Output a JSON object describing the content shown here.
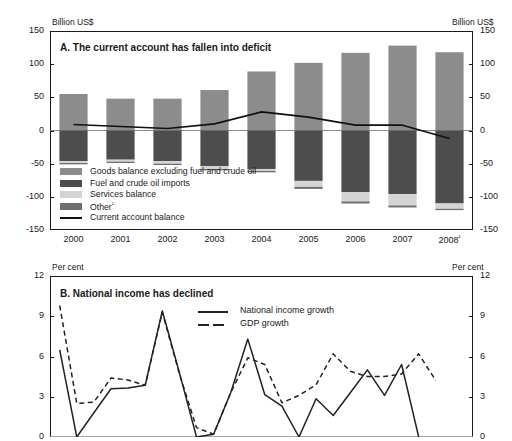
{
  "chart_data": [
    {
      "type": "bar",
      "id": "panel-a",
      "title": "A. The current account has fallen into deficit",
      "ylabel_left": "Billion US$",
      "ylabel_right": "Billion US$",
      "xlabel": "",
      "ylim": [
        -150,
        150
      ],
      "yticks": [
        150,
        100,
        50,
        0,
        -50,
        -100,
        -150
      ],
      "ytick_labels": [
        "150",
        "100",
        "50",
        "0",
        "-50",
        "-100",
        "-150"
      ],
      "grid": false,
      "stacked": true,
      "categories": [
        "2000",
        "2001",
        "2002",
        "2003",
        "2004",
        "2005",
        "2006",
        "2007",
        "2008"
      ],
      "category_labels": [
        "2000",
        "2001",
        "2002",
        "2003",
        "2004",
        "2005",
        "2006",
        "2007",
        "2008²"
      ],
      "series": [
        {
          "name": "Goods balance excluding fuel and crude oil",
          "color": "#8c8c8c",
          "values": [
            55,
            48,
            48,
            61,
            89,
            102,
            117,
            128,
            118
          ]
        },
        {
          "name": "Fuel and crude oil imports",
          "color": "#4d4d4d",
          "values": [
            -46,
            -44,
            -46,
            -54,
            -58,
            -76,
            -93,
            -96,
            -110
          ]
        },
        {
          "name": "Services balance",
          "color": "#d4d4d4",
          "values": [
            -3,
            -3,
            -4,
            -4,
            -3,
            -9,
            -14,
            -17,
            -8
          ]
        },
        {
          "name": "Other¹",
          "color": "#6e6e6e",
          "values": [
            -2,
            -2,
            -2,
            -2,
            -2,
            -3,
            -3,
            -3,
            -2
          ]
        }
      ],
      "line_series": [
        {
          "name": "Current account balance",
          "style": "solid",
          "color": "#111111",
          "values": [
            9,
            6,
            3,
            10,
            28,
            20,
            8,
            8,
            -12
          ]
        }
      ],
      "legend": [
        {
          "label": "Goods balance excluding fuel and crude oil",
          "type": "swatch",
          "color": "#8c8c8c"
        },
        {
          "label": "Fuel and crude oil imports",
          "type": "swatch",
          "color": "#4d4d4d"
        },
        {
          "label": "Services balance",
          "type": "swatch",
          "color": "#d4d4d4"
        },
        {
          "label": "Other¹",
          "type": "swatch",
          "color": "#6e6e6e"
        },
        {
          "label": "Current account balance",
          "type": "line",
          "color": "#111111"
        }
      ],
      "legend_position": "inside-lower-left"
    },
    {
      "type": "line",
      "id": "panel-b",
      "title": "B. National income has declined",
      "ylabel_left": "Per cent",
      "ylabel_right": "Per cent",
      "xlabel": "",
      "ylim": [
        0,
        12
      ],
      "yticks": [
        12,
        9,
        6,
        3,
        0
      ],
      "ytick_labels": [
        "12",
        "9",
        "6",
        "3",
        "0"
      ],
      "grid": false,
      "note": "x-axis tick labels are cut off below the image boundary",
      "x": [
        1,
        2,
        3,
        4,
        5,
        6,
        7,
        8,
        9,
        10,
        11,
        12,
        13,
        14,
        15,
        16,
        17,
        18,
        19,
        20,
        21,
        22,
        23,
        24
      ],
      "series": [
        {
          "name": "National income growth",
          "style": "solid",
          "color": "#222222",
          "values": [
            6.5,
            0.0,
            1.8,
            3.6,
            3.65,
            3.85,
            9.4,
            4.8,
            0.0,
            0.2,
            3.3,
            7.3,
            3.15,
            2.3,
            0.0,
            2.85,
            1.6,
            3.3,
            5.0,
            3.1,
            5.4,
            0.0,
            null,
            null
          ]
        },
        {
          "name": "GDP growth",
          "style": "dashed",
          "color": "#222222",
          "values": [
            9.8,
            2.5,
            2.6,
            4.4,
            4.25,
            3.85,
            9.3,
            4.7,
            0.7,
            0.2,
            3.3,
            5.9,
            5.4,
            2.55,
            3.1,
            3.9,
            6.2,
            4.9,
            4.5,
            4.5,
            4.7,
            6.2,
            4.2,
            null
          ]
        }
      ],
      "legend": [
        {
          "label": "National income growth",
          "type": "line-solid",
          "color": "#222222"
        },
        {
          "label": "GDP growth",
          "type": "line-dashed",
          "color": "#222222"
        }
      ],
      "legend_position": "inside-upper-right"
    }
  ]
}
